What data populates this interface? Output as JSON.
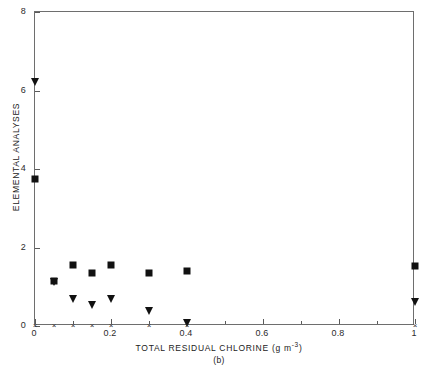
{
  "chart_data": {
    "type": "scatter",
    "title": "",
    "caption": "(b)",
    "xlabel_text": "TOTAL RESIDUAL CHLORINE (g m",
    "xlabel_exponent": "-3",
    "xlabel_suffix": ")",
    "xlabel": "TOTAL RESIDUAL CHLORINE (g m^-3)",
    "ylabel": "ELEMENTAL ANALYSES",
    "xlim": [
      0,
      1
    ],
    "ylim": [
      0,
      8
    ],
    "grid": false,
    "legend": "none",
    "xticks": [
      0,
      0.2,
      0.4,
      0.6,
      0.8,
      1
    ],
    "xticklabels": [
      "0",
      "0.2",
      "0.4",
      "0.6",
      "0.8",
      "1"
    ],
    "yticks": [
      0,
      2,
      4,
      6,
      8
    ],
    "yticklabels": [
      "0",
      "2",
      "4",
      "6",
      "8"
    ],
    "xminorticks": [
      0.1,
      0.3,
      0.5,
      0.7,
      0.9
    ],
    "series": [
      {
        "name": "square-series",
        "marker": "filled-square",
        "color": "#111111",
        "points": [
          {
            "x": 0,
            "y": 3.75
          },
          {
            "x": 0.05,
            "y": 1.15
          },
          {
            "x": 0.1,
            "y": 1.55
          },
          {
            "x": 0.15,
            "y": 1.35
          },
          {
            "x": 0.2,
            "y": 1.55
          },
          {
            "x": 0.3,
            "y": 1.35
          },
          {
            "x": 0.4,
            "y": 1.4
          },
          {
            "x": 1.0,
            "y": 1.52
          }
        ]
      },
      {
        "name": "triangle-series",
        "marker": "filled-down-triangle",
        "color": "#111111",
        "points": [
          {
            "x": 0,
            "y": 6.2
          },
          {
            "x": 0.05,
            "y": 1.1
          },
          {
            "x": 0.1,
            "y": 0.65
          },
          {
            "x": 0.15,
            "y": 0.5
          },
          {
            "x": 0.2,
            "y": 0.65
          },
          {
            "x": 0.3,
            "y": 0.35
          },
          {
            "x": 0.4,
            "y": 0.05
          },
          {
            "x": 1.0,
            "y": 0.58
          }
        ]
      },
      {
        "name": "cross-series",
        "marker": "cross",
        "color": "#333333",
        "points": [
          {
            "x": 0,
            "y": 0.03
          },
          {
            "x": 0.05,
            "y": 0.03
          },
          {
            "x": 0.1,
            "y": 0.03
          },
          {
            "x": 0.15,
            "y": 0.03
          },
          {
            "x": 0.2,
            "y": 0.03
          },
          {
            "x": 0.3,
            "y": 0.03
          },
          {
            "x": 0.4,
            "y": 0.03
          },
          {
            "x": 1.0,
            "y": 0.03
          }
        ]
      }
    ]
  }
}
